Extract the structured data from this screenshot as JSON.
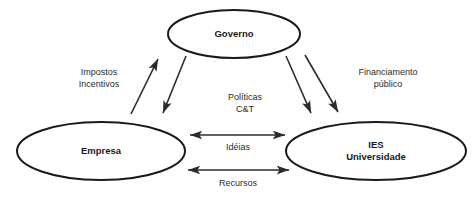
{
  "diagram": {
    "background_color": "#ffffff",
    "stroke_color": "#1a1a1a",
    "edge_color": "#2b2b2b",
    "nodes": [
      {
        "id": "governo",
        "label_lines": [
          "Governo"
        ],
        "cx": 234,
        "cy": 34,
        "rx": 66,
        "ry": 24
      },
      {
        "id": "empresa",
        "label_lines": [
          "Empresa"
        ],
        "cx": 101,
        "cy": 151,
        "rx": 84,
        "ry": 29
      },
      {
        "id": "ies",
        "label_lines": [
          "IES",
          "Universidade"
        ],
        "cx": 376,
        "cy": 151,
        "rx": 90,
        "ry": 29
      }
    ],
    "edges": [
      {
        "id": "impostos-incentivos",
        "label_lines": [
          "Impostos",
          "Incentivos"
        ],
        "label_x": 99,
        "label_y": 79,
        "from": "empresa",
        "to": "governo",
        "x1": 131,
        "y1": 114,
        "x2": 158,
        "y2": 59,
        "arrow_start": false,
        "arrow_end": true
      },
      {
        "id": "politicas-ct-empresa",
        "label_lines": [],
        "label_x": 0,
        "label_y": 0,
        "from": "governo",
        "to": "empresa",
        "x1": 186,
        "y1": 56,
        "x2": 163,
        "y2": 113,
        "arrow_start": false,
        "arrow_end": true
      },
      {
        "id": "politicas-ct-ies",
        "label_lines": [
          "Políticas",
          "C&T"
        ],
        "label_x": 245,
        "label_y": 104,
        "from": "governo",
        "to": "ies",
        "x1": 286,
        "y1": 56,
        "x2": 311,
        "y2": 113,
        "arrow_start": false,
        "arrow_end": true
      },
      {
        "id": "financiamento-publico",
        "label_lines": [
          "Financiamento",
          "público"
        ],
        "label_x": 388,
        "label_y": 79,
        "from": "governo",
        "to": "ies",
        "x1": 305,
        "y1": 55,
        "x2": 338,
        "y2": 112,
        "arrow_start": false,
        "arrow_end": true
      },
      {
        "id": "ideias",
        "label_lines": [
          "Idéias"
        ],
        "label_x": 238,
        "label_y": 148,
        "from": "empresa",
        "to": "ies",
        "x1": 190,
        "y1": 135,
        "x2": 285,
        "y2": 135,
        "arrow_start": true,
        "arrow_end": true
      },
      {
        "id": "recursos",
        "label_lines": [
          "Recursos"
        ],
        "label_x": 238,
        "label_y": 184,
        "from": "empresa",
        "to": "ies",
        "x1": 188,
        "y1": 170,
        "x2": 289,
        "y2": 170,
        "arrow_start": true,
        "arrow_end": true
      }
    ]
  }
}
